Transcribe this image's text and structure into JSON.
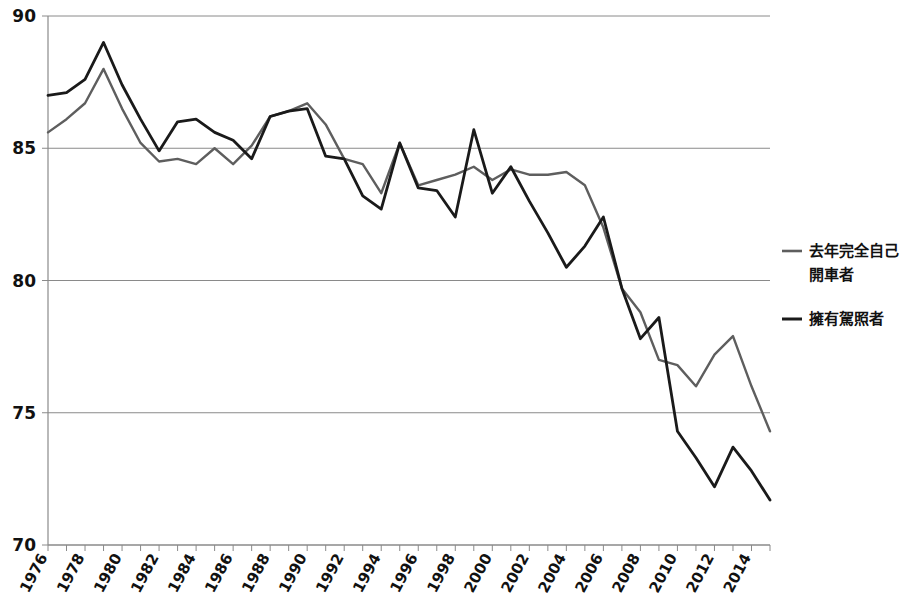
{
  "chart_data": {
    "type": "line",
    "title": "",
    "subtitle": "",
    "xlabel": "",
    "ylabel": "",
    "xlim": [
      1976,
      2015
    ],
    "ylim": [
      70,
      90
    ],
    "yticks": [
      70,
      75,
      80,
      85,
      90
    ],
    "ytick_labels": [
      "70",
      "75",
      "80",
      "85",
      "90"
    ],
    "grid": true,
    "legend_position": "right",
    "x": [
      1976,
      1977,
      1978,
      1979,
      1980,
      1981,
      1982,
      1983,
      1984,
      1985,
      1986,
      1987,
      1988,
      1989,
      1990,
      1991,
      1992,
      1993,
      1994,
      1995,
      1996,
      1997,
      1998,
      1999,
      2000,
      2001,
      2002,
      2003,
      2004,
      2005,
      2006,
      2007,
      2008,
      2009,
      2010,
      2011,
      2012,
      2013,
      2014,
      2015
    ],
    "x_tick_labels": [
      "1976",
      "1978",
      "1980",
      "1982",
      "1984",
      "1986",
      "1988",
      "1990",
      "1992",
      "1994",
      "1996",
      "1998",
      "2000",
      "2002",
      "2004",
      "2006",
      "2008",
      "2010",
      "2012",
      "2014"
    ],
    "series": [
      {
        "name": "去年完全自己開車者",
        "color": "#5e5e5e",
        "width": 2.4,
        "values": [
          85.6,
          86.1,
          86.7,
          88.0,
          86.5,
          85.2,
          84.5,
          84.6,
          84.4,
          85.0,
          84.4,
          85.1,
          86.2,
          86.4,
          86.7,
          85.9,
          84.6,
          84.4,
          83.3,
          85.2,
          83.6,
          83.8,
          84.0,
          84.3,
          83.8,
          84.2,
          84.0,
          84.0,
          84.1,
          83.6,
          82.0,
          79.7,
          78.8,
          77.0,
          76.8,
          76.0,
          77.2,
          77.9,
          76.0,
          74.3
        ]
      },
      {
        "name": "擁有駕照者",
        "color": "#1a1a1a",
        "width": 2.8,
        "values": [
          87.0,
          87.1,
          87.6,
          89.0,
          87.4,
          86.1,
          84.9,
          86.0,
          86.1,
          85.6,
          85.3,
          84.6,
          86.2,
          86.4,
          86.5,
          84.7,
          84.6,
          83.2,
          82.7,
          85.2,
          83.5,
          83.4,
          82.4,
          85.7,
          83.3,
          84.3,
          83.0,
          81.8,
          80.5,
          81.3,
          82.4,
          79.7,
          77.8,
          78.6,
          74.3,
          73.3,
          72.2,
          73.7,
          72.8,
          71.7
        ]
      }
    ]
  },
  "legend": {
    "items": [
      {
        "label_line1": "去年完全自己",
        "label_line2": "開車者",
        "color": "#5e5e5e"
      },
      {
        "label_line1": "擁有駕照者",
        "label_line2": "",
        "color": "#1a1a1a"
      }
    ]
  }
}
